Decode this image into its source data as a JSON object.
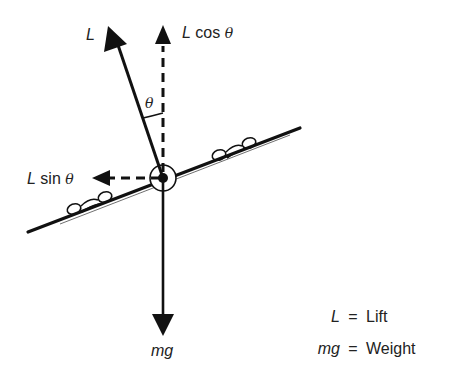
{
  "diagram": {
    "vectors": {
      "lift": {
        "label": "L"
      },
      "lift_vertical": {
        "label_main": "L",
        "label_func": " cos ",
        "label_angle": "θ"
      },
      "lift_horizontal": {
        "label_main": "L",
        "label_func": " sin ",
        "label_angle": "θ"
      },
      "weight": {
        "label": "mg"
      }
    },
    "angle": {
      "label": "θ"
    },
    "legend": [
      {
        "symbol": "L",
        "equals": "=",
        "meaning": "Lift"
      },
      {
        "symbol": "mg",
        "equals": "=",
        "meaning": "Weight"
      }
    ],
    "colors": {
      "stroke": "#111111",
      "text": "#222222",
      "background": "#ffffff"
    }
  }
}
